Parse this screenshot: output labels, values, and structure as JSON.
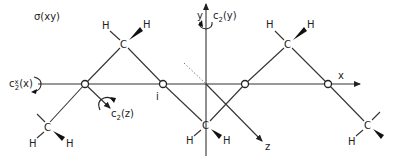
{
  "diagram": {
    "title_label": "σ(xy)",
    "axes": {
      "x": {
        "label": "x"
      },
      "y": {
        "label": "y"
      },
      "z": {
        "label": "z"
      }
    },
    "symmetry_elements": {
      "c2_y": {
        "base": "c",
        "sub": "2",
        "arg": "(y)"
      },
      "c2_z": {
        "base": "c",
        "sub": "2",
        "arg": "(z)"
      },
      "c2_x": {
        "base": "c",
        "sup": "x",
        "sub": "2",
        "arg": "(x)"
      },
      "inversion": "i"
    },
    "atoms": {
      "carbon": "C",
      "hydrogen": "H"
    },
    "carbons": [
      {
        "id": "c-upper-left",
        "label": "C",
        "h_left": "H",
        "h_right": "H"
      },
      {
        "id": "c-upper-right",
        "label": "C",
        "h_left": "H",
        "h_right": "H"
      },
      {
        "id": "c-lower-left",
        "label": "C",
        "h_left": "H",
        "h_right": "H"
      },
      {
        "id": "c-lower-center",
        "label": "C",
        "h_left": "H",
        "h_right": "H"
      },
      {
        "id": "c-lower-right",
        "label": "C",
        "h_left": "H"
      }
    ],
    "bond_centers_count": 4,
    "colors": {
      "ink": "#222222",
      "background": "#ffffff",
      "dotted": "#777777"
    }
  }
}
